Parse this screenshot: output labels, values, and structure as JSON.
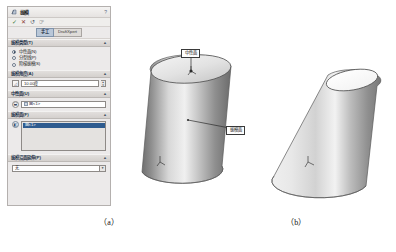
{
  "panel": {
    "title": "拔模",
    "icon_name": "draft-feature-icon",
    "help_label": "?",
    "tools": [
      {
        "name": "confirm",
        "glyph": "✓"
      },
      {
        "name": "cancel",
        "glyph": "✕"
      },
      {
        "name": "undo",
        "glyph": "↺"
      },
      {
        "name": "preview",
        "glyph": "☞"
      }
    ],
    "tabs": [
      {
        "label": "手工",
        "selected": true
      },
      {
        "label": "DraftXpert",
        "selected": false
      }
    ],
    "sections": {
      "draft_type": {
        "title": "拔模类型(T)",
        "options": [
          {
            "label": "中性面(N)",
            "selected": true
          },
          {
            "label": "分型线(P)",
            "selected": false
          },
          {
            "label": "阶梯拔模(S)",
            "selected": false
          }
        ]
      },
      "draft_angle": {
        "title": "拔模角度(A)",
        "icon_name": "angle-icon",
        "value": "10.00度"
      },
      "neutral_plane": {
        "title": "中性面(U)",
        "icon_name": "neutral-plane-picker-icon",
        "chip": "面<1>"
      },
      "draft_faces": {
        "title": "拔模面(F)",
        "icon_name": "draft-face-picker-icon",
        "items": [
          {
            "label": "面<1>",
            "selected": true
          }
        ]
      },
      "face_propagation": {
        "title": "拔模沿面延伸(P)",
        "value": "无"
      }
    }
  },
  "figures": {
    "cylinder": {
      "name": "cylinder-model",
      "callouts": [
        {
          "name": "neutral-plane-callout",
          "label": "中性面"
        },
        {
          "name": "draft-face-callout",
          "label": "拔模面"
        }
      ],
      "caption": "（a）"
    },
    "cone": {
      "name": "drafted-cone-model",
      "caption": "（b）"
    }
  },
  "colors": {
    "panel_bg": "#eceaea",
    "section_header": "#d9d5d2",
    "selection_blue": "#2e5b8f",
    "tab_active": "#b9c7d8",
    "model_gray": "#9a9a9a"
  }
}
